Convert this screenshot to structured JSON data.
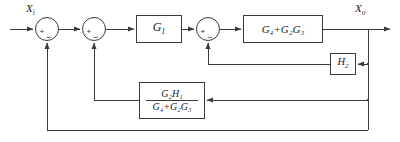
{
  "diagram": {
    "type": "block-diagram",
    "line_color": "#3a3a3a",
    "text_color": "#1b1b1b",
    "background": "#ffffff"
  },
  "signals": {
    "input_label": "X",
    "input_sub": "i",
    "output_label": "X",
    "output_sub": "o"
  },
  "blocks": {
    "g1": {
      "label": "G",
      "sub": "1"
    },
    "forward": {
      "label": "G₄+G₂G₃"
    },
    "h2": {
      "label": "H",
      "sub": "2"
    },
    "fraction": {
      "numerator": "G₂H₁",
      "denominator": "G₄+G₂G₃"
    }
  },
  "summing_junctions": [
    {
      "name": "sum-1",
      "left_sign": "+",
      "bottom_sign": "−"
    },
    {
      "name": "sum-2",
      "left_sign": "+",
      "bottom_sign": "−"
    },
    {
      "name": "sum-3",
      "left_sign": "+",
      "bottom_sign": "−"
    }
  ]
}
